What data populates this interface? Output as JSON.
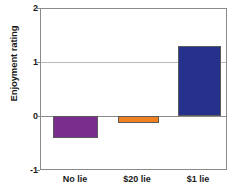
{
  "chart_data": {
    "type": "bar",
    "title": "",
    "xlabel": "",
    "ylabel": "Enjoyment rating",
    "categories": [
      "No lie",
      "$20 lie",
      "$1 lie"
    ],
    "values": [
      -0.41,
      -0.13,
      1.31
    ],
    "ylim": [
      -1,
      2
    ],
    "yticks": [
      2,
      1,
      0,
      -1
    ],
    "ytick_labels": [
      "2",
      "1",
      "0",
      "-1"
    ],
    "grid": true,
    "legend": false,
    "bar_colors": [
      "#7b2d8e",
      "#f08020",
      "#26318c"
    ],
    "series": [
      {
        "name": "Enjoyment rating",
        "values": [
          -0.41,
          -0.13,
          1.31
        ]
      }
    ]
  },
  "axis": {
    "y_title": "Enjoyment rating",
    "tick_2": "2",
    "tick_1": "1",
    "tick_0": "0",
    "tick_neg1": "-1"
  },
  "categories": {
    "c0": "No lie",
    "c1": "$20 lie",
    "c2": "$1 lie"
  },
  "colors": {
    "purple": "#7b2d8e",
    "orange": "#f08020",
    "blue": "#26318c",
    "frame": "#8a8a8a",
    "grid": "#b9b9b9",
    "text": "#1a1a1a",
    "background": "#ffffff"
  }
}
